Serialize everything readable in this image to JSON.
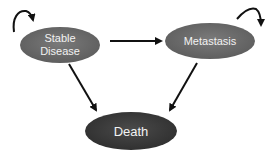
{
  "diagram": {
    "type": "state-transition",
    "nodes": [
      {
        "id": "stable",
        "label_lines": [
          "Stable",
          "Disease"
        ],
        "fill": "#6e6e6e"
      },
      {
        "id": "metastasis",
        "label_lines": [
          "Metastasis"
        ],
        "fill": "#6e6e6e"
      },
      {
        "id": "death",
        "label_lines": [
          "Death"
        ],
        "fill": "#3e3e3e"
      }
    ],
    "edges": [
      {
        "from": "stable",
        "to": "stable",
        "kind": "self-loop"
      },
      {
        "from": "metastasis",
        "to": "metastasis",
        "kind": "self-loop"
      },
      {
        "from": "stable",
        "to": "metastasis"
      },
      {
        "from": "stable",
        "to": "death"
      },
      {
        "from": "metastasis",
        "to": "death"
      }
    ],
    "colors": {
      "arrow": "#111111",
      "node_text": "#f2f2f2"
    }
  }
}
